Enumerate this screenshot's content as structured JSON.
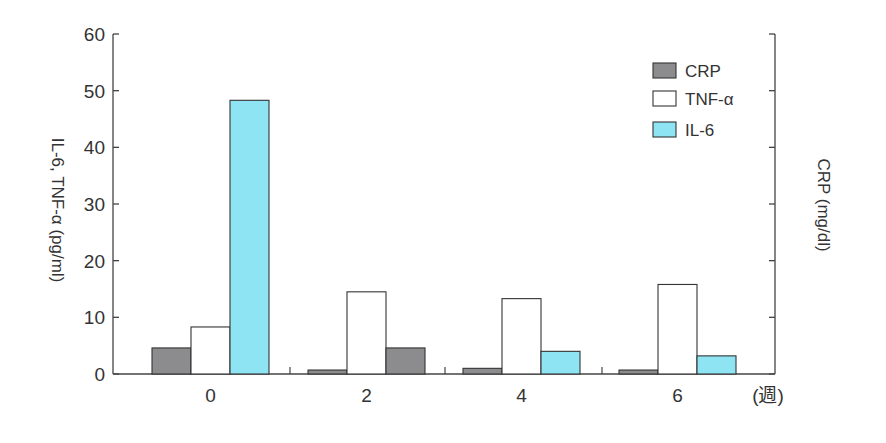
{
  "chart_data": {
    "type": "bar",
    "title": "",
    "xlabel": "",
    "x_unit_label": "(週)",
    "ylabel": "IL-6, TNF-α (pg/ml)",
    "ylabel_right": "CRP (mg/dl)",
    "ylim": [
      0,
      60
    ],
    "yticks": [
      0,
      10,
      20,
      30,
      40,
      50,
      60
    ],
    "right_axis_ticks_unlabeled": 6,
    "grid": false,
    "legend_position": "upper right",
    "categories": [
      "0",
      "2",
      "4",
      "6"
    ],
    "series": [
      {
        "name": "CRP",
        "color": "#8c8c8e",
        "values": [
          4.6,
          0.7,
          1.0,
          0.7
        ]
      },
      {
        "name": "TNF-α",
        "color": "#ffffff",
        "values": [
          8.3,
          14.5,
          13.3,
          15.8
        ]
      },
      {
        "name": "IL-6",
        "color": "#8fe4f4",
        "values": [
          48.3,
          4.6,
          4.0,
          3.2
        ],
        "bar_colors": [
          "#8fe4f4",
          "#8c8c8e",
          "#8fe4f4",
          "#8fe4f4"
        ]
      }
    ]
  },
  "legend": {
    "items": [
      {
        "label": "CRP",
        "color": "#8c8c8e"
      },
      {
        "label": "TNF-α",
        "color": "#ffffff"
      },
      {
        "label": "IL-6",
        "color": "#8fe4f4"
      }
    ]
  },
  "axes": {
    "left_title": "IL-6, TNF-α (pg/ml)",
    "right_title": "CRP (mg/dl)",
    "x_unit": "(週)"
  }
}
